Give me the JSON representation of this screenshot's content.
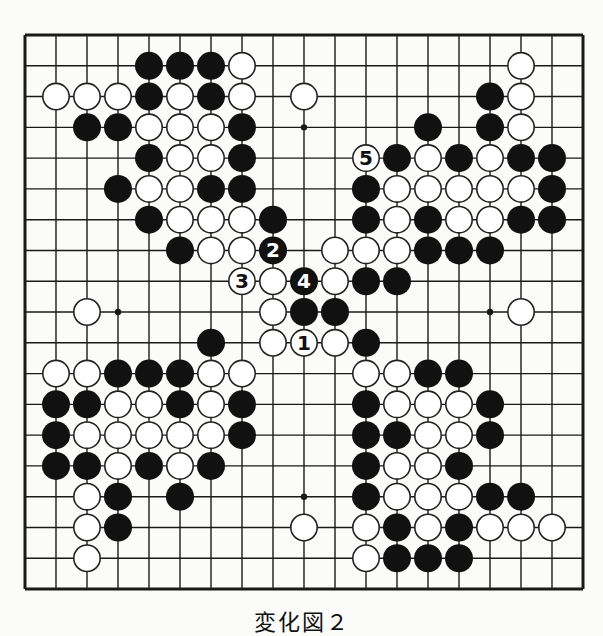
{
  "diagram": {
    "type": "go-board-fragment",
    "grid": {
      "columns": 19,
      "rows": 19,
      "origin_x": 25,
      "origin_y": 35,
      "step_x": 31,
      "step_y": 30.78
    },
    "colors": {
      "background": "#fbfbf9",
      "line": "#1a1a1a",
      "black_stone": "#111111",
      "white_stone": "#ffffff",
      "stone_outline": "#222222"
    },
    "hoshi": [
      [
        9,
        3
      ],
      [
        3,
        9
      ],
      [
        15,
        9
      ],
      [
        9,
        15
      ]
    ],
    "stones": {
      "black": [
        [
          4,
          1
        ],
        [
          5,
          1
        ],
        [
          6,
          1
        ],
        [
          4,
          2
        ],
        [
          6,
          2
        ],
        [
          15,
          2
        ],
        [
          2,
          3
        ],
        [
          3,
          3
        ],
        [
          7,
          3
        ],
        [
          13,
          3
        ],
        [
          15,
          3
        ],
        [
          4,
          4
        ],
        [
          7,
          4
        ],
        [
          12,
          4
        ],
        [
          14,
          4
        ],
        [
          16,
          4
        ],
        [
          17,
          4
        ],
        [
          3,
          5
        ],
        [
          6,
          5
        ],
        [
          7,
          5
        ],
        [
          11,
          5
        ],
        [
          17,
          5
        ],
        [
          4,
          6
        ],
        [
          8,
          6
        ],
        [
          11,
          6
        ],
        [
          13,
          6
        ],
        [
          16,
          6
        ],
        [
          17,
          6
        ],
        [
          5,
          7
        ],
        [
          13,
          7
        ],
        [
          14,
          7
        ],
        [
          15,
          7
        ],
        [
          11,
          8
        ],
        [
          12,
          8
        ],
        [
          9,
          9
        ],
        [
          10,
          9
        ],
        [
          6,
          10
        ],
        [
          11,
          10
        ],
        [
          3,
          11
        ],
        [
          4,
          11
        ],
        [
          5,
          11
        ],
        [
          13,
          11
        ],
        [
          14,
          11
        ],
        [
          1,
          12
        ],
        [
          2,
          12
        ],
        [
          5,
          12
        ],
        [
          7,
          12
        ],
        [
          11,
          12
        ],
        [
          15,
          12
        ],
        [
          1,
          13
        ],
        [
          7,
          13
        ],
        [
          11,
          13
        ],
        [
          12,
          13
        ],
        [
          15,
          13
        ],
        [
          1,
          14
        ],
        [
          2,
          14
        ],
        [
          4,
          14
        ],
        [
          6,
          14
        ],
        [
          11,
          14
        ],
        [
          14,
          14
        ],
        [
          3,
          15
        ],
        [
          5,
          15
        ],
        [
          11,
          15
        ],
        [
          15,
          15
        ],
        [
          16,
          15
        ],
        [
          3,
          16
        ],
        [
          12,
          16
        ],
        [
          14,
          16
        ],
        [
          12,
          17
        ],
        [
          13,
          17
        ],
        [
          14,
          17
        ]
      ],
      "white": [
        [
          7,
          1
        ],
        [
          16,
          1
        ],
        [
          1,
          2
        ],
        [
          2,
          2
        ],
        [
          3,
          2
        ],
        [
          5,
          2
        ],
        [
          7,
          2
        ],
        [
          9,
          2
        ],
        [
          16,
          2
        ],
        [
          4,
          3
        ],
        [
          5,
          3
        ],
        [
          6,
          3
        ],
        [
          16,
          3
        ],
        [
          5,
          4
        ],
        [
          6,
          4
        ],
        [
          13,
          4
        ],
        [
          15,
          4
        ],
        [
          4,
          5
        ],
        [
          5,
          5
        ],
        [
          12,
          5
        ],
        [
          13,
          5
        ],
        [
          14,
          5
        ],
        [
          15,
          5
        ],
        [
          16,
          5
        ],
        [
          5,
          6
        ],
        [
          6,
          6
        ],
        [
          7,
          6
        ],
        [
          12,
          6
        ],
        [
          14,
          6
        ],
        [
          15,
          6
        ],
        [
          6,
          7
        ],
        [
          7,
          7
        ],
        [
          10,
          7
        ],
        [
          11,
          7
        ],
        [
          12,
          7
        ],
        [
          8,
          8
        ],
        [
          10,
          8
        ],
        [
          2,
          9
        ],
        [
          8,
          9
        ],
        [
          16,
          9
        ],
        [
          8,
          10
        ],
        [
          10,
          10
        ],
        [
          1,
          11
        ],
        [
          2,
          11
        ],
        [
          6,
          11
        ],
        [
          7,
          11
        ],
        [
          11,
          11
        ],
        [
          12,
          11
        ],
        [
          3,
          12
        ],
        [
          4,
          12
        ],
        [
          6,
          12
        ],
        [
          12,
          12
        ],
        [
          13,
          12
        ],
        [
          14,
          12
        ],
        [
          2,
          13
        ],
        [
          3,
          13
        ],
        [
          4,
          13
        ],
        [
          5,
          13
        ],
        [
          6,
          13
        ],
        [
          13,
          13
        ],
        [
          14,
          13
        ],
        [
          3,
          14
        ],
        [
          5,
          14
        ],
        [
          12,
          14
        ],
        [
          13,
          14
        ],
        [
          2,
          15
        ],
        [
          12,
          15
        ],
        [
          13,
          15
        ],
        [
          14,
          15
        ],
        [
          2,
          16
        ],
        [
          9,
          16
        ],
        [
          11,
          16
        ],
        [
          13,
          16
        ],
        [
          15,
          16
        ],
        [
          16,
          16
        ],
        [
          17,
          16
        ],
        [
          2,
          17
        ],
        [
          11,
          17
        ]
      ]
    },
    "numbered_moves": [
      {
        "number": "1",
        "color": "white",
        "pos": [
          9,
          10
        ]
      },
      {
        "number": "2",
        "color": "black",
        "pos": [
          8,
          7
        ]
      },
      {
        "number": "3",
        "color": "white",
        "pos": [
          7,
          8
        ]
      },
      {
        "number": "4",
        "color": "black",
        "pos": [
          9,
          8
        ]
      },
      {
        "number": "5",
        "color": "white",
        "pos": [
          11,
          4
        ]
      }
    ],
    "caption": "変化図２"
  }
}
